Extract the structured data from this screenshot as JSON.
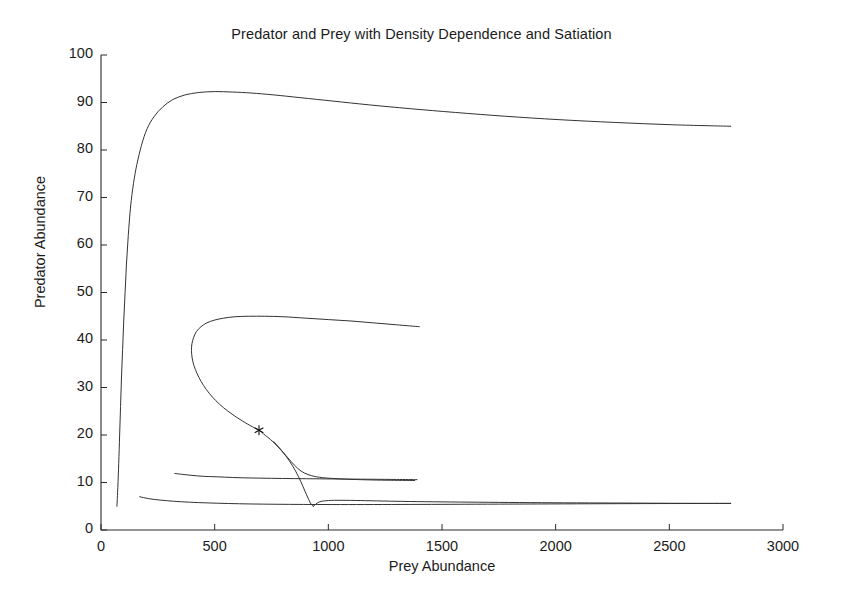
{
  "chart_data": {
    "type": "line",
    "title": "Predator and Prey with Density Dependence and Satiation",
    "xlabel": "Prey Abundance",
    "ylabel": "Predator Abundance",
    "xlim": [
      0,
      3000
    ],
    "ylim": [
      0,
      100
    ],
    "xticks": [
      0,
      500,
      1000,
      1500,
      2000,
      2500,
      3000
    ],
    "yticks": [
      0,
      10,
      20,
      30,
      40,
      50,
      60,
      70,
      80,
      90,
      100
    ],
    "xtick_labels": [
      "0",
      "500",
      "1000",
      "1500",
      "2000",
      "2500",
      "3000"
    ],
    "ytick_labels": [
      "0",
      "10",
      "20",
      "30",
      "40",
      "50",
      "60",
      "70",
      "80",
      "90",
      "100"
    ],
    "grid": false,
    "legend": null,
    "line_color": "#333333",
    "line_width": 1,
    "background": "#ffffff",
    "annotations": [
      {
        "name": "equilibrium-marker",
        "marker": "asterisk",
        "x": 695,
        "y": 21,
        "label": "*"
      }
    ],
    "series": [
      {
        "name": "outer-trajectory",
        "comment": "Large outward spiral arm: rises steeply at low prey to predator ~92, then decays slowly to the right",
        "points": [
          [
            70,
            5
          ],
          [
            74,
            9
          ],
          [
            78,
            14
          ],
          [
            82,
            20
          ],
          [
            86,
            26
          ],
          [
            90,
            32
          ],
          [
            95,
            38
          ],
          [
            100,
            44
          ],
          [
            106,
            50
          ],
          [
            112,
            56
          ],
          [
            120,
            62
          ],
          [
            130,
            68
          ],
          [
            143,
            73
          ],
          [
            158,
            77
          ],
          [
            178,
            81
          ],
          [
            203,
            84.5
          ],
          [
            233,
            87
          ],
          [
            270,
            89
          ],
          [
            315,
            90.6
          ],
          [
            370,
            91.6
          ],
          [
            430,
            92.1
          ],
          [
            500,
            92.3
          ],
          [
            580,
            92.2
          ],
          [
            660,
            92.0
          ],
          [
            760,
            91.6
          ],
          [
            880,
            91.0
          ],
          [
            1020,
            90.3
          ],
          [
            1180,
            89.5
          ],
          [
            1360,
            88.7
          ],
          [
            1560,
            87.9
          ],
          [
            1780,
            87.1
          ],
          [
            2010,
            86.4
          ],
          [
            2260,
            85.8
          ],
          [
            2520,
            85.3
          ],
          [
            2770,
            85.0
          ]
        ]
      },
      {
        "name": "inner-spiral-trajectory",
        "comment": "Inner loop from upper right, curls left to prey~400, turns down through the equilibrium asterisk and falls to the lower branch",
        "points": [
          [
            1400,
            42.8
          ],
          [
            1300,
            43.2
          ],
          [
            1200,
            43.6
          ],
          [
            1100,
            44.0
          ],
          [
            1000,
            44.3
          ],
          [
            900,
            44.6
          ],
          [
            800,
            44.9
          ],
          [
            720,
            45.0
          ],
          [
            650,
            45.0
          ],
          [
            590,
            44.9
          ],
          [
            540,
            44.6
          ],
          [
            500,
            44.2
          ],
          [
            465,
            43.6
          ],
          [
            440,
            42.8
          ],
          [
            420,
            41.8
          ],
          [
            408,
            40.6
          ],
          [
            400,
            39.2
          ],
          [
            398,
            37.8
          ],
          [
            401,
            36.2
          ],
          [
            409,
            34.6
          ],
          [
            422,
            33.0
          ],
          [
            440,
            31.3
          ],
          [
            463,
            29.6
          ],
          [
            490,
            28.0
          ],
          [
            521,
            26.5
          ],
          [
            556,
            25.1
          ],
          [
            594,
            23.8
          ],
          [
            634,
            22.6
          ],
          [
            675,
            21.5
          ],
          [
            695,
            21.0
          ],
          [
            716,
            20.2
          ],
          [
            756,
            18.6
          ],
          [
            794,
            16.7
          ],
          [
            828,
            14.6
          ],
          [
            856,
            12.4
          ],
          [
            879,
            10.2
          ],
          [
            897,
            8.2
          ],
          [
            911,
            6.7
          ],
          [
            921,
            5.7
          ],
          [
            928,
            5.2
          ],
          [
            934,
            5.0
          ]
        ]
      },
      {
        "name": "mid-lower-trajectory",
        "comment": "Branch starting near prey 325 at predator ~12, flattening rightward to about predator 10.5 at prey 1390",
        "points": [
          [
            325,
            11.9
          ],
          [
            360,
            11.7
          ],
          [
            400,
            11.5
          ],
          [
            450,
            11.3
          ],
          [
            510,
            11.2
          ],
          [
            580,
            11.05
          ],
          [
            660,
            10.95
          ],
          [
            750,
            10.88
          ],
          [
            850,
            10.82
          ],
          [
            960,
            10.77
          ],
          [
            1080,
            10.72
          ],
          [
            1200,
            10.68
          ],
          [
            1300,
            10.64
          ],
          [
            1390,
            10.6
          ]
        ]
      },
      {
        "name": "bottom-trajectory",
        "comment": "Low branch starting near prey 170 at predator ~7, dipping to ~5.3 and extending far right to prey 2770",
        "points": [
          [
            170,
            7.0
          ],
          [
            210,
            6.6
          ],
          [
            260,
            6.3
          ],
          [
            320,
            6.05
          ],
          [
            390,
            5.85
          ],
          [
            470,
            5.7
          ],
          [
            560,
            5.58
          ],
          [
            660,
            5.48
          ],
          [
            770,
            5.42
          ],
          [
            890,
            5.38
          ],
          [
            1020,
            5.36
          ],
          [
            1160,
            5.36
          ],
          [
            1320,
            5.38
          ],
          [
            1500,
            5.4
          ],
          [
            1700,
            5.44
          ],
          [
            1920,
            5.48
          ],
          [
            2150,
            5.52
          ],
          [
            2400,
            5.56
          ],
          [
            2600,
            5.58
          ],
          [
            2770,
            5.6
          ]
        ]
      },
      {
        "name": "upper-lower-branch",
        "comment": "Short branch leaving the descending spiral near predator 19 and running right, settling near predator 10.4 at prey 1380",
        "points": [
          [
            760,
            18.6
          ],
          [
            790,
            17.0
          ],
          [
            820,
            15.3
          ],
          [
            850,
            13.7
          ],
          [
            880,
            12.4
          ],
          [
            915,
            11.6
          ],
          [
            960,
            11.1
          ],
          [
            1020,
            10.85
          ],
          [
            1090,
            10.68
          ],
          [
            1170,
            10.56
          ],
          [
            1260,
            10.48
          ],
          [
            1380,
            10.42
          ]
        ]
      },
      {
        "name": "lower-right-branch",
        "comment": "Branch leaving the spiral bottom near predator 6 and running right toward prey 2770 at predator 5.6",
        "points": [
          [
            934,
            5.0
          ],
          [
            960,
            5.9
          ],
          [
            1000,
            6.2
          ],
          [
            1060,
            6.25
          ],
          [
            1140,
            6.2
          ],
          [
            1240,
            6.1
          ],
          [
            1360,
            6.0
          ],
          [
            1500,
            5.92
          ],
          [
            1660,
            5.85
          ],
          [
            1840,
            5.78
          ],
          [
            2040,
            5.72
          ],
          [
            2260,
            5.68
          ],
          [
            2500,
            5.63
          ],
          [
            2770,
            5.6
          ]
        ]
      }
    ]
  },
  "figure": {
    "plot_left_px": 101,
    "plot_right_px": 783,
    "plot_top_px": 55,
    "plot_bottom_px": 530
  }
}
